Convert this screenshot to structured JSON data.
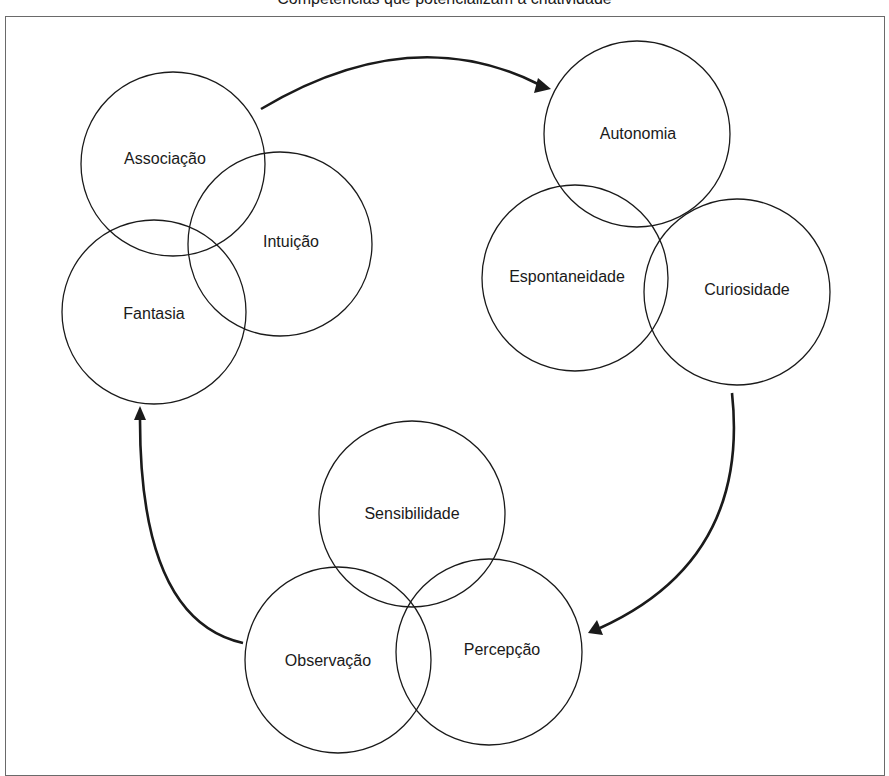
{
  "title": "Competências que potencializam a criatividade",
  "colors": {
    "stroke": "#1a1a1a",
    "frame": "#6a6a6a",
    "background": "#ffffff"
  },
  "groups": [
    {
      "name": "group-1",
      "circles": [
        {
          "label": "Associação",
          "cx": 173,
          "cy": 164,
          "r": 92,
          "lx": 165,
          "ly": 159
        },
        {
          "label": "Intuição",
          "cx": 280,
          "cy": 244,
          "r": 92,
          "lx": 291,
          "ly": 242
        },
        {
          "label": "Fantasia",
          "cx": 154,
          "cy": 312,
          "r": 92,
          "lx": 154,
          "ly": 314
        }
      ]
    },
    {
      "name": "group-2",
      "circles": [
        {
          "label": "Autonomia",
          "cx": 637,
          "cy": 134,
          "r": 93,
          "lx": 638,
          "ly": 134
        },
        {
          "label": "Espontaneidade",
          "cx": 575,
          "cy": 278,
          "r": 93,
          "lx": 567,
          "ly": 277
        },
        {
          "label": "Curiosidade",
          "cx": 737,
          "cy": 292,
          "r": 93,
          "lx": 747,
          "ly": 290
        }
      ]
    },
    {
      "name": "group-3",
      "circles": [
        {
          "label": "Sensibilidade",
          "cx": 412,
          "cy": 514,
          "r": 93,
          "lx": 412,
          "ly": 514
        },
        {
          "label": "Observação",
          "cx": 338,
          "cy": 660,
          "r": 93,
          "lx": 328,
          "ly": 661
        },
        {
          "label": "Percepção",
          "cx": 489,
          "cy": 652,
          "r": 93,
          "lx": 502,
          "ly": 650
        }
      ]
    }
  ],
  "arrows": [
    {
      "name": "arrow-group1-to-group2",
      "path": "M 261 109 Q 410 20 538 84",
      "head": "551,89 534,93 538,78"
    },
    {
      "name": "arrow-group2-to-group3",
      "path": "M 732 393 Q 750 560 600 628",
      "head": "588,633 597,620 603,635"
    },
    {
      "name": "arrow-group3-to-group1",
      "path": "M 243 643 Q 140 620 140 420",
      "head": "140,406 134,420 146,420"
    }
  ]
}
